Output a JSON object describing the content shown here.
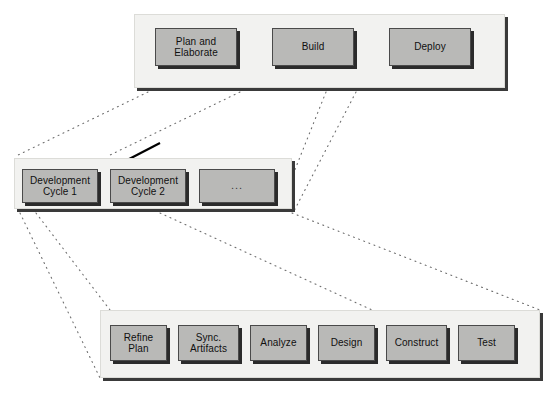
{
  "diagram": {
    "colors": {
      "panel_fill": "#f2f2f0",
      "box_fill": "#b9b9b7",
      "box_border": "#4a4a4a",
      "shadow": "#2b2b2b",
      "dotted_connector": "#6f6f6f",
      "arrow": "#000000",
      "background": "#ffffff"
    },
    "tiers": [
      {
        "name": "phases",
        "panel": {
          "x": 134,
          "y": 14,
          "w": 371,
          "h": 74
        },
        "boxes": [
          {
            "label": "Plan and\nElaborate",
            "x": 155,
            "y": 28,
            "w": 82,
            "h": 38
          },
          {
            "label": "Build",
            "x": 272,
            "y": 28,
            "w": 82,
            "h": 38
          },
          {
            "label": "Deploy",
            "x": 389,
            "y": 28,
            "w": 82,
            "h": 38
          }
        ]
      },
      {
        "name": "development-cycles",
        "panel": {
          "x": 14,
          "y": 158,
          "w": 278,
          "h": 51
        },
        "boxes": [
          {
            "label": "Development\nCycle 1",
            "x": 22,
            "y": 169,
            "w": 76,
            "h": 34
          },
          {
            "label": "Development\nCycle 2",
            "x": 110,
            "y": 169,
            "w": 76,
            "h": 34
          },
          {
            "label": "...",
            "x": 199,
            "y": 169,
            "w": 76,
            "h": 34,
            "ellipsis": true
          }
        ]
      },
      {
        "name": "cycle-activities",
        "panel": {
          "x": 100,
          "y": 310,
          "w": 440,
          "h": 68
        },
        "boxes": [
          {
            "label": "Refine\nPlan",
            "x": 110,
            "y": 325,
            "w": 57,
            "h": 36
          },
          {
            "label": "Sync.\nArtifacts",
            "x": 178,
            "y": 325,
            "w": 61,
            "h": 36
          },
          {
            "label": "Analyze",
            "x": 250,
            "y": 325,
            "w": 57,
            "h": 36
          },
          {
            "label": "Design",
            "x": 318,
            "y": 325,
            "w": 57,
            "h": 36
          },
          {
            "label": "Construct",
            "x": 386,
            "y": 325,
            "w": 61,
            "h": 36
          },
          {
            "label": "Test",
            "x": 458,
            "y": 325,
            "w": 57,
            "h": 36
          }
        ]
      }
    ],
    "connectors": {
      "phases_to_cycles": [
        {
          "x1": 148,
          "y1": 92,
          "x2": 16,
          "y2": 156
        },
        {
          "x1": 240,
          "y1": 92,
          "x2": 108,
          "y2": 156
        },
        {
          "x1": 326,
          "y1": 92,
          "x2": 294,
          "y2": 172
        },
        {
          "x1": 356,
          "y1": 92,
          "x2": 294,
          "y2": 211
        }
      ],
      "cycles_to_activities": [
        {
          "x1": 20,
          "y1": 213,
          "x2": 100,
          "y2": 378
        },
        {
          "x1": 36,
          "y1": 213,
          "x2": 110,
          "y2": 310
        },
        {
          "x1": 160,
          "y1": 213,
          "x2": 372,
          "y2": 310
        },
        {
          "x1": 292,
          "y1": 213,
          "x2": 540,
          "y2": 310
        }
      ],
      "arrow": {
        "x1": 160,
        "y1": 143,
        "x2": 106,
        "y2": 171
      }
    }
  }
}
